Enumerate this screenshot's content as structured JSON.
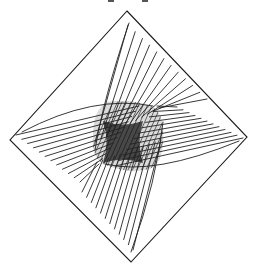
{
  "figure": {
    "ink_color": "#1a1a1a",
    "background": "#ffffff",
    "diamond": {
      "top": [
        127,
        11
      ],
      "right": [
        247,
        137
      ],
      "bottom": [
        131,
        262
      ],
      "left": [
        10,
        140
      ]
    },
    "center": [
      124,
      140
    ],
    "core": {
      "inner_square": {
        "x": [
          103,
          143
        ],
        "y": [
          121,
          163
        ],
        "concave": true
      },
      "outer_region": {
        "x": [
          93,
          163
        ],
        "y": [
          102,
          170
        ]
      }
    },
    "families": [
      {
        "name": "upper",
        "count": 12,
        "direction": "from top-right edge toward center, steep"
      },
      {
        "name": "right",
        "count": 12,
        "direction": "from right edge toward center, shallow"
      },
      {
        "name": "lower",
        "count": 12,
        "direction": "from bottom edge toward center, steep"
      },
      {
        "name": "left",
        "count": 12,
        "direction": "from left edge toward center, shallow"
      }
    ]
  }
}
